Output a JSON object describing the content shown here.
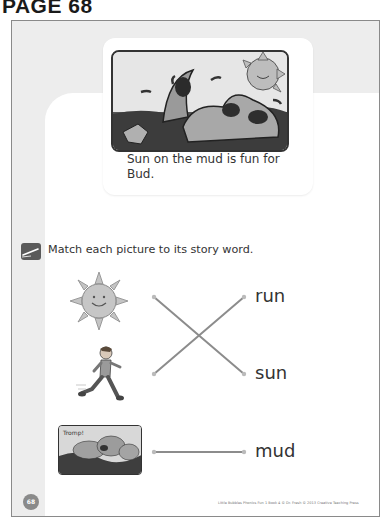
{
  "page_label": "PAGE 68",
  "story": {
    "caption": "Sun on the mud is fun for Bud."
  },
  "activity": {
    "instruction": "Match each picture to its story word.",
    "pictures": [
      {
        "name": "sun-picture",
        "depicts": "smiling sun"
      },
      {
        "name": "running-boy-picture",
        "depicts": "boy running"
      },
      {
        "name": "mud-picture",
        "depicts": "pups in mud",
        "label": "Tromp!"
      }
    ],
    "words": [
      "run",
      "sun",
      "mud"
    ],
    "matches": [
      {
        "picture": "sun",
        "word": "sun"
      },
      {
        "picture": "running boy",
        "word": "run"
      },
      {
        "picture": "mud",
        "word": "mud"
      }
    ]
  },
  "footer": {
    "page_number": "68",
    "credit": "Little Bubbles Phonics Fun 1 Book 4 © Dr. Fresh © 2013 Creative Teaching Press"
  },
  "colors": {
    "frame_gray": "#ededed",
    "border": "#8a8a8a",
    "line": "#888888",
    "text": "#333333"
  }
}
